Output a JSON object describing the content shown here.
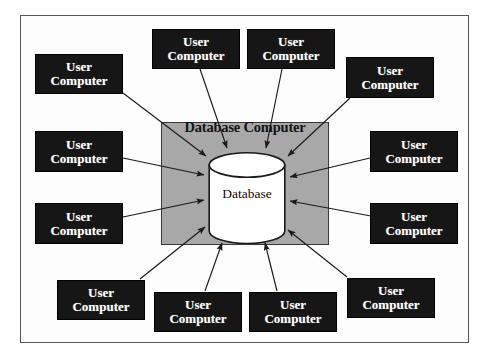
{
  "diagram": {
    "frame": {
      "border_color": "#555555",
      "background": "#fdfdfd"
    },
    "server": {
      "label": "Database Computer",
      "fill_color": "#a8a8a8",
      "border_color": "#3a3a3a"
    },
    "database": {
      "label": "Database",
      "fill_color": "#ffffff",
      "border_color": "#1a1a1a",
      "shape": "cylinder"
    },
    "node_style": {
      "fill_color": "#161616",
      "text_color": "#ffffff"
    },
    "nodes": [
      {
        "id": "node-top-left-outer",
        "line1": "User",
        "line2": "Computer"
      },
      {
        "id": "node-top-center-left",
        "line1": "User",
        "line2": "Computer"
      },
      {
        "id": "node-top-center-right",
        "line1": "User",
        "line2": "Computer"
      },
      {
        "id": "node-top-right-outer",
        "line1": "User",
        "line2": "Computer"
      },
      {
        "id": "node-left-upper",
        "line1": "User",
        "line2": "Computer"
      },
      {
        "id": "node-left-lower",
        "line1": "User",
        "line2": "Computer"
      },
      {
        "id": "node-right-upper",
        "line1": "User",
        "line2": "Computer"
      },
      {
        "id": "node-right-lower",
        "line1": "User",
        "line2": "Computer"
      },
      {
        "id": "node-bottom-left-outer",
        "line1": "User",
        "line2": "Computer"
      },
      {
        "id": "node-bottom-center-left",
        "line1": "User",
        "line2": "Computer"
      },
      {
        "id": "node-bottom-center-right",
        "line1": "User",
        "line2": "Computer"
      },
      {
        "id": "node-bottom-right-outer",
        "line1": "User",
        "line2": "Computer"
      }
    ],
    "connections": {
      "count": 12,
      "direction": "user-computer-to-database",
      "arrow_color": "#1a1a1a"
    }
  }
}
